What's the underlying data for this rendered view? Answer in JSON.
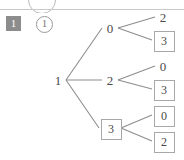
{
  "window": {
    "top_chrome": {
      "circle_icon_name": "circle-outline",
      "rule_visible": true
    }
  },
  "header": {
    "step_badge": "1",
    "info_icon_label": "1"
  },
  "diagram": {
    "type": "tree",
    "title": "",
    "root": {
      "label": "1",
      "boxed": false
    },
    "nodes": [
      {
        "id": "root",
        "label": "1",
        "boxed": false,
        "x": 58,
        "y": 80
      },
      {
        "id": "n0",
        "label": "0",
        "boxed": false,
        "x": 110,
        "y": 28
      },
      {
        "id": "n0a",
        "label": "2",
        "boxed": false,
        "x": 163,
        "y": 17
      },
      {
        "id": "n0b",
        "label": "3",
        "boxed": true,
        "x": 163,
        "y": 40
      },
      {
        "id": "n2",
        "label": "2",
        "boxed": false,
        "x": 110,
        "y": 80
      },
      {
        "id": "n2a",
        "label": "0",
        "boxed": false,
        "x": 163,
        "y": 66
      },
      {
        "id": "n2b",
        "label": "3",
        "boxed": true,
        "x": 163,
        "y": 89
      },
      {
        "id": "n3",
        "label": "3",
        "boxed": true,
        "x": 110,
        "y": 128
      },
      {
        "id": "n3a",
        "label": "0",
        "boxed": true,
        "x": 163,
        "y": 115
      },
      {
        "id": "n3b",
        "label": "2",
        "boxed": true,
        "x": 163,
        "y": 141
      }
    ],
    "edges": [
      {
        "from": "root",
        "to": "n0"
      },
      {
        "from": "root",
        "to": "n2"
      },
      {
        "from": "root",
        "to": "n3"
      },
      {
        "from": "n0",
        "to": "n0a"
      },
      {
        "from": "n0",
        "to": "n0b"
      },
      {
        "from": "n2",
        "to": "n2a"
      },
      {
        "from": "n2",
        "to": "n2b"
      },
      {
        "from": "n3",
        "to": "n3a"
      },
      {
        "from": "n3",
        "to": "n3b"
      }
    ]
  },
  "colors": {
    "background": "#ffffff",
    "line": "#8d8d8d",
    "text": "#4a4a4a",
    "box_border": "#a8a8a8",
    "badge_bg": "#8c8c8c",
    "badge_text": "#ffffff",
    "rule": "#c9c9c9"
  }
}
